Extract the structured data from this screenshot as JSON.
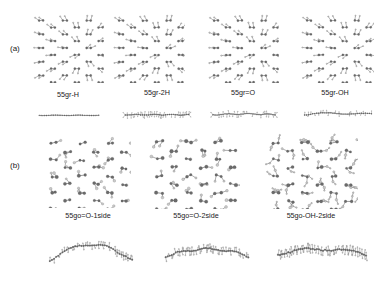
{
  "figure": {
    "panels": [
      {
        "id": "a",
        "label": "(a)"
      },
      {
        "id": "b",
        "label": "(b)"
      }
    ]
  },
  "panel_a": {
    "structures": [
      {
        "key": "gr_h",
        "label": "55gr-H",
        "top_view": "honeycomb graphene sheet with edge hydrogen",
        "side_view": "flat planar line of atoms"
      },
      {
        "key": "gr_2h",
        "label": "55gr-2H",
        "top_view": "honeycomb graphene sheet with two-sided hydrogen",
        "side_view": "slightly corrugated line with atoms above and below"
      },
      {
        "key": "gr_o",
        "label": "55gr=O",
        "top_view": "graphene sheet with epoxide oxygen",
        "side_view": "near-planar line with oxygen decorations"
      },
      {
        "key": "gr_oh",
        "label": "55gr-OH",
        "top_view": "graphene sheet with hydroxyl groups",
        "side_view": "gently wavy line of atoms"
      }
    ]
  },
  "panel_b": {
    "structures": [
      {
        "key": "go_o_1side",
        "label": "55go=O-1side",
        "top_view": "distorted graphene oxide sheet, oxygen on one side",
        "side_view": "strongly arched curved sheet"
      },
      {
        "key": "go_o_2side",
        "label": "55go=O-2side",
        "top_view": "distorted graphene oxide sheet, oxygen on both sides",
        "side_view": "gently arched sheet"
      },
      {
        "key": "go_oh_2side",
        "label": "55go-OH-2side",
        "top_view": "graphene oxide sheet with hydroxyl groups on both sides",
        "side_view": "rough undulating sheet"
      }
    ]
  },
  "colors": {
    "background": "#ffffff",
    "atom_carbon": "#6b6b6b",
    "atom_light": "#c9c9c9",
    "bond": "#555555",
    "text": "#1a1a1a"
  }
}
